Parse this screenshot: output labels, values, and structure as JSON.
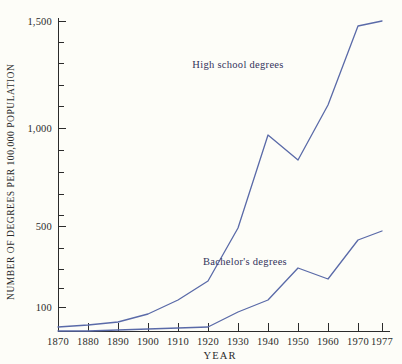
{
  "chart_data": {
    "type": "line",
    "title": "",
    "xlabel": "YEAR",
    "ylabel": "NUMBER OF DEGREES PER 100,000 POPULATION",
    "x": [
      1870,
      1880,
      1890,
      1900,
      1910,
      1920,
      1930,
      1940,
      1950,
      1960,
      1970,
      1977
    ],
    "xlim": [
      1870,
      1977
    ],
    "ylim": [
      0,
      1500
    ],
    "grid": false,
    "legend_position": "inline-annotation",
    "y_tick_labels": [
      "100",
      "500",
      "1,000",
      "1,500"
    ],
    "y_major_ticks": [
      100,
      500,
      1000,
      1500
    ],
    "y_minor_ticks": [
      200,
      300,
      400,
      600,
      700,
      800,
      900,
      1100,
      1200,
      1300,
      1400
    ],
    "x_tick_labels": [
      "1870",
      "1880",
      "1890",
      "1900",
      "1910",
      "1920",
      "1930",
      "1940",
      "1950",
      "1960",
      "1970",
      "1977"
    ],
    "series": [
      {
        "name": "High school degrees",
        "color": "#5a6aa8",
        "values": [
          20,
          25,
          35,
          65,
          100,
          160,
          350,
          650,
          540,
          780,
          1380,
          1420
        ],
        "annotation": "High school degrees"
      },
      {
        "name": "Bachelor's degrees",
        "color": "#5a6aa8",
        "values": [
          14,
          14,
          18,
          26,
          40,
          50,
          90,
          130,
          240,
          190,
          390,
          440
        ],
        "annotation": "Bachelor's degrees"
      }
    ]
  },
  "axes": {
    "y_title": "NUMBER OF DEGREES PER 100,000 POPULATION",
    "x_title": "YEAR"
  },
  "annotations": {
    "high_school": "High school degrees",
    "bachelors": "Bachelor's degrees"
  },
  "ticks": {
    "y": [
      {
        "label": "1,500",
        "y": 21
      },
      {
        "label": "1,000",
        "y": 128
      },
      {
        "label": "500",
        "y": 226
      },
      {
        "label": "100",
        "y": 307
      }
    ],
    "y_minor_positions": [
      42,
      63,
      85,
      106,
      150,
      172,
      194,
      215,
      248,
      269,
      288
    ],
    "x": [
      {
        "label": "1870",
        "x": 58
      },
      {
        "label": "1880",
        "x": 88
      },
      {
        "label": "1890",
        "x": 118
      },
      {
        "label": "1900",
        "x": 148
      },
      {
        "label": "1910",
        "x": 178
      },
      {
        "label": "1920",
        "x": 208
      },
      {
        "label": "1930",
        "x": 238
      },
      {
        "label": "1940",
        "x": 268
      },
      {
        "label": "1950",
        "x": 298
      },
      {
        "label": "1960",
        "x": 328
      },
      {
        "label": "1970",
        "x": 358
      },
      {
        "label": "1977",
        "x": 382
      }
    ]
  },
  "series_paths": {
    "high_school": "M 58,327 L 88,325 L 118,322 L 148,314 L 178,300 L 208,281 L 238,228 L 268,135 L 298,160 L 328,105 L 358,26 L 382,21",
    "bachelors": "M 58,331 L 88,331 L 118,330 L 148,329 L 178,328 L 208,327 L 238,312 L 268,300 L 298,268 L 328,279 L 358,240 L 382,231"
  },
  "annotation_positions": {
    "high_school": {
      "x": 238,
      "y": 68
    },
    "bachelors": {
      "x": 245,
      "y": 265
    }
  }
}
